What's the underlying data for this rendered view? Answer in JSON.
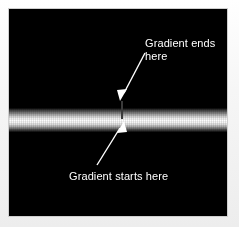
{
  "figure": {
    "canvas_background": "#000000",
    "page_background": "#f2f2f2"
  },
  "graphic": {
    "bar": {
      "name": "gradient-bar",
      "orientation": "horizontal",
      "gradient_axis": "vertical",
      "edge_color": "#000000",
      "center_color": "#ffffff",
      "description": "Horizontal band filled with a vertical black-to-white-to-black gradient"
    }
  },
  "annotations": {
    "end_label": {
      "text": "Gradient ends\nhere",
      "color": "#ffffff",
      "points_to": "top edge of gradient bar"
    },
    "start_label": {
      "text": "Gradient starts here",
      "color": "#ffffff",
      "points_to": "center of gradient bar"
    }
  },
  "colors": {
    "text": "#ffffff",
    "arrow": "#ffffff",
    "marker_line": "#3a3a3a",
    "panel": "#000000",
    "page": "#f2f2f2"
  }
}
